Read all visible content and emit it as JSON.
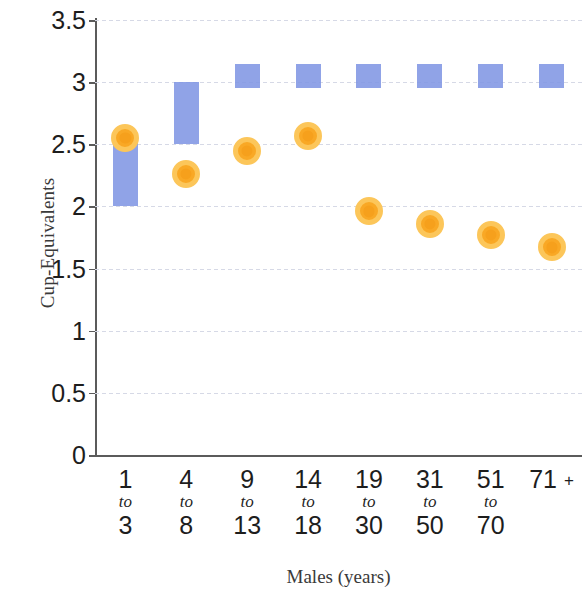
{
  "chart_data": {
    "type": "bar",
    "title": "",
    "subtitle": "",
    "xlabel": "Males (years)",
    "ylabel": "Cup-Equivalents",
    "ylim": [
      0,
      3.5
    ],
    "ytick_labels": [
      "0",
      "0.5",
      "1",
      "1.5",
      "2",
      "2.5",
      "3",
      "3.5"
    ],
    "ytick_values": [
      0,
      0.5,
      1,
      1.5,
      2,
      2.5,
      3,
      3.5
    ],
    "grid": true,
    "legend": "none",
    "categories": [
      "1 to 3",
      "4 to 8",
      "9 to 13",
      "14 to 18",
      "19 to 30",
      "31 to 50",
      "51 to 70",
      "71 +"
    ],
    "category_parts": [
      {
        "lo": "1",
        "mid": "to",
        "hi": "3"
      },
      {
        "lo": "4",
        "mid": "to",
        "hi": "8"
      },
      {
        "lo": "9",
        "mid": "to",
        "hi": "13"
      },
      {
        "lo": "14",
        "mid": "to",
        "hi": "18"
      },
      {
        "lo": "19",
        "mid": "to",
        "hi": "30"
      },
      {
        "lo": "31",
        "mid": "to",
        "hi": "50"
      },
      {
        "lo": "51",
        "mid": "to",
        "hi": "70"
      },
      {
        "lo": "71 +",
        "mid": "",
        "hi": ""
      }
    ],
    "series": [
      {
        "name": "Recommended range",
        "type": "range-bar",
        "color": "#8196e4",
        "low": [
          2.0,
          2.5,
          2.95,
          2.95,
          2.95,
          2.95,
          2.95,
          2.95
        ],
        "high": [
          2.55,
          3.0,
          3.15,
          3.15,
          3.15,
          3.15,
          3.15,
          3.15
        ]
      },
      {
        "name": "Average intake",
        "type": "marker",
        "color": "#f9a825",
        "ring_color": "#fcc65a",
        "values": [
          2.55,
          2.26,
          2.45,
          2.57,
          1.96,
          1.86,
          1.77,
          1.67
        ]
      }
    ]
  },
  "colors": {
    "bar": "#8196e4",
    "marker": "#f9a825",
    "marker_ring": "#fcc65a",
    "axis": "#5b5b5b",
    "grid": "#d6d9e6",
    "text": "#1d1d1d",
    "axis_title": "#3a3a3a",
    "background": "#ffffff"
  }
}
